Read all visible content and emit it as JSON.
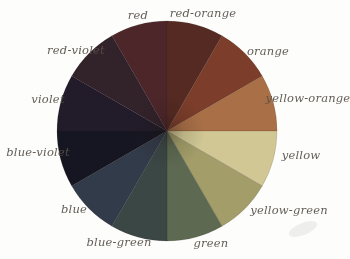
{
  "figure": {
    "background_color": "#fdfdfb",
    "label_text_color": "#56504a"
  },
  "chart_data": {
    "type": "pie",
    "legend_position": "labels-around-wheel",
    "start_angle_deg": -30,
    "slice_angle_deg": 30,
    "segments": [
      {
        "label": "red",
        "color": "#4e282a",
        "value": 1
      },
      {
        "label": "red-orange",
        "color": "#552c23",
        "value": 1
      },
      {
        "label": "orange",
        "color": "#7c3e2a",
        "value": 1
      },
      {
        "label": "yellow-orange",
        "color": "#a97046",
        "value": 1
      },
      {
        "label": "yellow",
        "color": "#d0c795",
        "value": 1
      },
      {
        "label": "yellow-green",
        "color": "#a29d69",
        "value": 1
      },
      {
        "label": "green",
        "color": "#5d6a51",
        "value": 1
      },
      {
        "label": "blue-green",
        "color": "#3a4645",
        "value": 1
      },
      {
        "label": "blue",
        "color": "#323b49",
        "value": 1
      },
      {
        "label": "blue-violet",
        "color": "#181922",
        "value": 1
      },
      {
        "label": "violet",
        "color": "#231d2c",
        "value": 1
      },
      {
        "label": "red-violet",
        "color": "#32202b",
        "value": 1
      }
    ]
  }
}
